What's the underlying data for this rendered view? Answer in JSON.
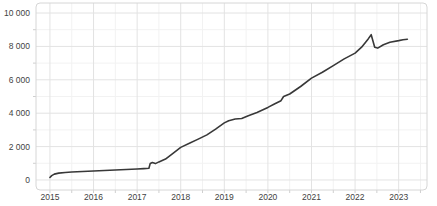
{
  "chart_data": {
    "type": "line",
    "title": "",
    "xlabel": "",
    "ylabel": "",
    "legend": "none",
    "grid": "on",
    "x_tick_labels": [
      "2015",
      "2016",
      "2017",
      "2018",
      "2019",
      "2020",
      "2021",
      "2022",
      "2023"
    ],
    "x_tick_values": [
      2015,
      2016,
      2017,
      2018,
      2019,
      2020,
      2021,
      2022,
      2023
    ],
    "x_minor_tick_values": [
      2015.5,
      2016.5,
      2017.5,
      2018.5,
      2019.5,
      2020.5,
      2021.5,
      2022.5,
      2023.5
    ],
    "y_tick_labels": [
      "0",
      "2 000",
      "4 000",
      "6 000",
      "8 000",
      "10 000"
    ],
    "y_tick_values": [
      0,
      2000,
      4000,
      6000,
      8000,
      10000
    ],
    "y_minor_tick_values": [
      1000,
      3000,
      5000,
      7000,
      9000
    ],
    "xlim": [
      2014.68,
      2023.65
    ],
    "ylim": [
      -600,
      10600
    ],
    "series": [
      {
        "name": "value",
        "color": "#383838",
        "points": [
          [
            2015.0,
            150
          ],
          [
            2015.04,
            260
          ],
          [
            2015.1,
            350
          ],
          [
            2015.2,
            410
          ],
          [
            2015.35,
            450
          ],
          [
            2015.5,
            480
          ],
          [
            2015.75,
            510
          ],
          [
            2016.0,
            540
          ],
          [
            2016.25,
            570
          ],
          [
            2016.5,
            595
          ],
          [
            2016.75,
            625
          ],
          [
            2017.0,
            655
          ],
          [
            2017.15,
            680
          ],
          [
            2017.27,
            700
          ],
          [
            2017.3,
            980
          ],
          [
            2017.35,
            1040
          ],
          [
            2017.42,
            980
          ],
          [
            2017.5,
            1080
          ],
          [
            2017.65,
            1250
          ],
          [
            2017.8,
            1550
          ],
          [
            2018.0,
            1950
          ],
          [
            2018.2,
            2200
          ],
          [
            2018.4,
            2450
          ],
          [
            2018.6,
            2700
          ],
          [
            2018.8,
            3050
          ],
          [
            2019.0,
            3420
          ],
          [
            2019.1,
            3550
          ],
          [
            2019.25,
            3650
          ],
          [
            2019.4,
            3680
          ],
          [
            2019.55,
            3850
          ],
          [
            2019.75,
            4050
          ],
          [
            2020.0,
            4350
          ],
          [
            2020.15,
            4550
          ],
          [
            2020.3,
            4750
          ],
          [
            2020.36,
            5000
          ],
          [
            2020.5,
            5150
          ],
          [
            2020.75,
            5600
          ],
          [
            2021.0,
            6100
          ],
          [
            2021.25,
            6450
          ],
          [
            2021.5,
            6850
          ],
          [
            2021.75,
            7250
          ],
          [
            2022.0,
            7600
          ],
          [
            2022.15,
            7950
          ],
          [
            2022.3,
            8450
          ],
          [
            2022.37,
            8700
          ],
          [
            2022.45,
            7950
          ],
          [
            2022.52,
            7900
          ],
          [
            2022.65,
            8100
          ],
          [
            2022.8,
            8250
          ],
          [
            2023.0,
            8350
          ],
          [
            2023.1,
            8400
          ],
          [
            2023.2,
            8430
          ]
        ]
      }
    ],
    "colors": {
      "background": "#ffffff",
      "plot_border": "#d6d6d6",
      "major_grid": "#e3e3e3",
      "minor_grid": "#f2f2f2",
      "tick_mark": "#cfcfcf",
      "label_text": "#3f3f3f",
      "line": "#383838"
    }
  }
}
